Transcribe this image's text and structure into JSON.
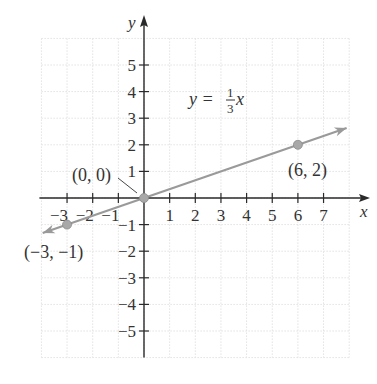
{
  "chart_data": {
    "type": "line",
    "title": "",
    "xlabel": "x",
    "ylabel": "y",
    "xlim": [
      -4,
      8
    ],
    "ylim": [
      -6,
      6
    ],
    "grid": true,
    "x_ticks": [
      -3,
      -2,
      -1,
      1,
      2,
      3,
      4,
      5,
      6,
      7
    ],
    "x_tick_labels": [
      "−3",
      "−2",
      "−1",
      "1",
      "2",
      "3",
      "4",
      "5",
      "6",
      "7"
    ],
    "y_ticks": [
      5,
      4,
      3,
      2,
      1,
      -1,
      -2,
      -3,
      -4,
      -5
    ],
    "y_tick_labels": [
      "5",
      "4",
      "3",
      "2",
      "1",
      "−1",
      "−2",
      "−3",
      "−4",
      "−5"
    ],
    "series": [
      {
        "name": "y = (1/3)x",
        "equation": "y = 1/3 x",
        "slope": 0.3333,
        "intercept": 0,
        "x": [
          -3.95,
          7.9
        ],
        "y": [
          -1.3167,
          2.6333
        ],
        "arrows": "both",
        "color": "#9a9a9a"
      }
    ],
    "points": [
      {
        "x": -3,
        "y": -1,
        "label": "(−3, −1)"
      },
      {
        "x": 0,
        "y": 0,
        "label": "(0, 0)"
      },
      {
        "x": 6,
        "y": 2,
        "label": "(6, 2)"
      }
    ],
    "annotations": [
      {
        "text": "y = 1/3 x",
        "x": 2.3,
        "y": 3.3
      }
    ]
  },
  "labels": {
    "x_axis": "x",
    "y_axis": "y",
    "equation_lhs": "y =",
    "equation_num": "1",
    "equation_den": "3",
    "equation_var": "x",
    "point_neg": "(−3, −1)",
    "point_origin": "(0, 0)",
    "point_pos": "(6, 2)"
  },
  "colors": {
    "axis": "#2a2a2a",
    "line": "#9a9a9a",
    "point": "#a8a8a8",
    "grid": "#e2e2e2",
    "text": "#333333"
  }
}
